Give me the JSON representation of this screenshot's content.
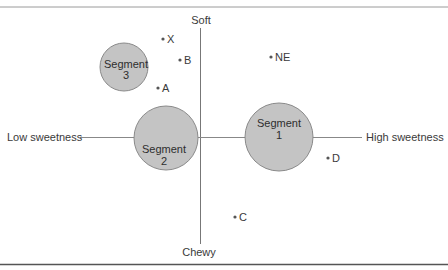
{
  "diagram": {
    "type": "perceptual map",
    "axes": {
      "vertical_top": "Soft",
      "vertical_bottom": "Chewy",
      "horizontal_left": "Low sweetness",
      "horizontal_right": "High sweetness"
    },
    "segments": [
      {
        "id": "seg1",
        "line1": "Segment",
        "line2": "1",
        "cx": 279,
        "cy": 137,
        "r": 34
      },
      {
        "id": "seg2",
        "line1": "Segment",
        "line2": "2",
        "cx": 166,
        "cy": 138,
        "r": 32
      },
      {
        "id": "seg3",
        "line1": "Segment",
        "line2": "3",
        "cx": 124,
        "cy": 67,
        "r": 24
      }
    ],
    "points": [
      {
        "label": "X",
        "x": 165,
        "y": 39
      },
      {
        "label": "B",
        "x": 182,
        "y": 59
      },
      {
        "label": "A",
        "x": 160,
        "y": 87
      },
      {
        "label": "NE",
        "x": 272,
        "y": 56
      },
      {
        "label": "D",
        "x": 328,
        "y": 157
      },
      {
        "label": "C",
        "x": 236,
        "y": 216
      }
    ],
    "colors": {
      "segment_fill": "#c4c4c4",
      "segment_stroke": "#8a8a8a",
      "axis": "#777777",
      "rule": "#555555",
      "point": "#555555"
    }
  }
}
